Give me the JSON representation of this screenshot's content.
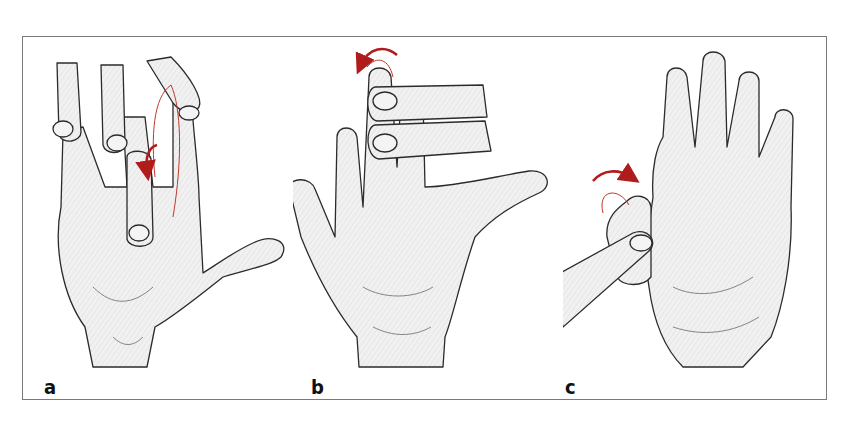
{
  "figure": {
    "panels": [
      {
        "label": "a",
        "description": "Middle finger flexed at PIP joint while examiner's finger presses the adjacent finger; arrow shows downward flexion motion"
      },
      {
        "label": "b",
        "description": "Examiner's two fingers hold the ring and little fingers extended; arrow shows backward motion of middle finger tip"
      },
      {
        "label": "c",
        "description": "Palm view; examiner holds thumb, arrow shows flexion of thumb tip at IP joint"
      }
    ],
    "colors": {
      "frame": "#7a7a7a",
      "arrow": "#b01c1c",
      "arrow_trace": "#c0392b",
      "skin_outline": "#2b2b2b",
      "background": "#ffffff"
    }
  }
}
